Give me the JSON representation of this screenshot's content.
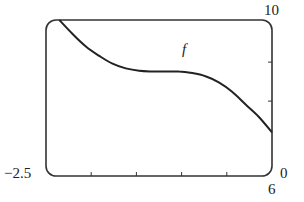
{
  "chart_data": {
    "type": "line",
    "title": "",
    "xlabel": "",
    "ylabel": "",
    "xlim": [
      -2.5,
      6
    ],
    "ylim": [
      0,
      10
    ],
    "grid": false,
    "x_tick_labels": {
      "left": "−2.5",
      "right": "6"
    },
    "y_tick_labels": {
      "top": "10",
      "bottom": "0"
    },
    "x_minor_ticks": [
      -0.8,
      0.9,
      2.6,
      4.3
    ],
    "y_minor_ticks": [
      7.3,
      4.8
    ],
    "series": [
      {
        "name": "f",
        "x": [
          -2.0,
          -1.5,
          -1.0,
          -0.5,
          0.0,
          0.5,
          1.0,
          1.5,
          2.0,
          2.5,
          3.0,
          3.5,
          4.0,
          4.5,
          5.0,
          5.5,
          6.0
        ],
        "y": [
          10.0,
          9.1,
          8.3,
          7.7,
          7.2,
          6.9,
          6.75,
          6.7,
          6.7,
          6.7,
          6.6,
          6.4,
          6.0,
          5.4,
          4.6,
          3.8,
          2.8
        ]
      }
    ],
    "annotations": [
      {
        "text": "f",
        "x": 2.2,
        "y": 7.6
      }
    ]
  },
  "labels": {
    "x_min": "−2.5",
    "x_max": "6",
    "y_max": "10",
    "y_min": "0",
    "curve": "f"
  }
}
